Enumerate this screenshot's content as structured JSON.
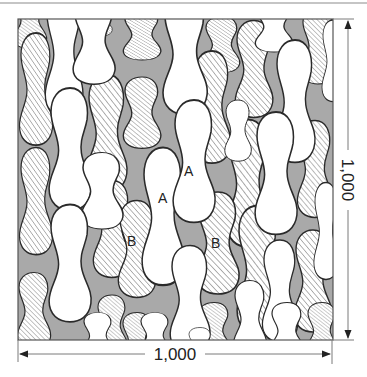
{
  "figure": {
    "colors": {
      "background": "#a9a9a9",
      "white_blob": "#ffffff",
      "hatched_blob_fill": "#ffffff",
      "hatch_stroke": "#9a9a9a",
      "outline": "#2a2a2a",
      "rule": "#8c8c8c"
    },
    "labels": [
      {
        "text": "A",
        "x": 190,
        "y": 175
      },
      {
        "text": "A",
        "x": 164,
        "y": 202
      },
      {
        "text": "B",
        "x": 133,
        "y": 245
      },
      {
        "text": "B",
        "x": 217,
        "y": 247
      }
    ],
    "dimensions": {
      "horizontal": {
        "label": "1,000"
      },
      "vertical": {
        "label": "1,000"
      }
    }
  }
}
